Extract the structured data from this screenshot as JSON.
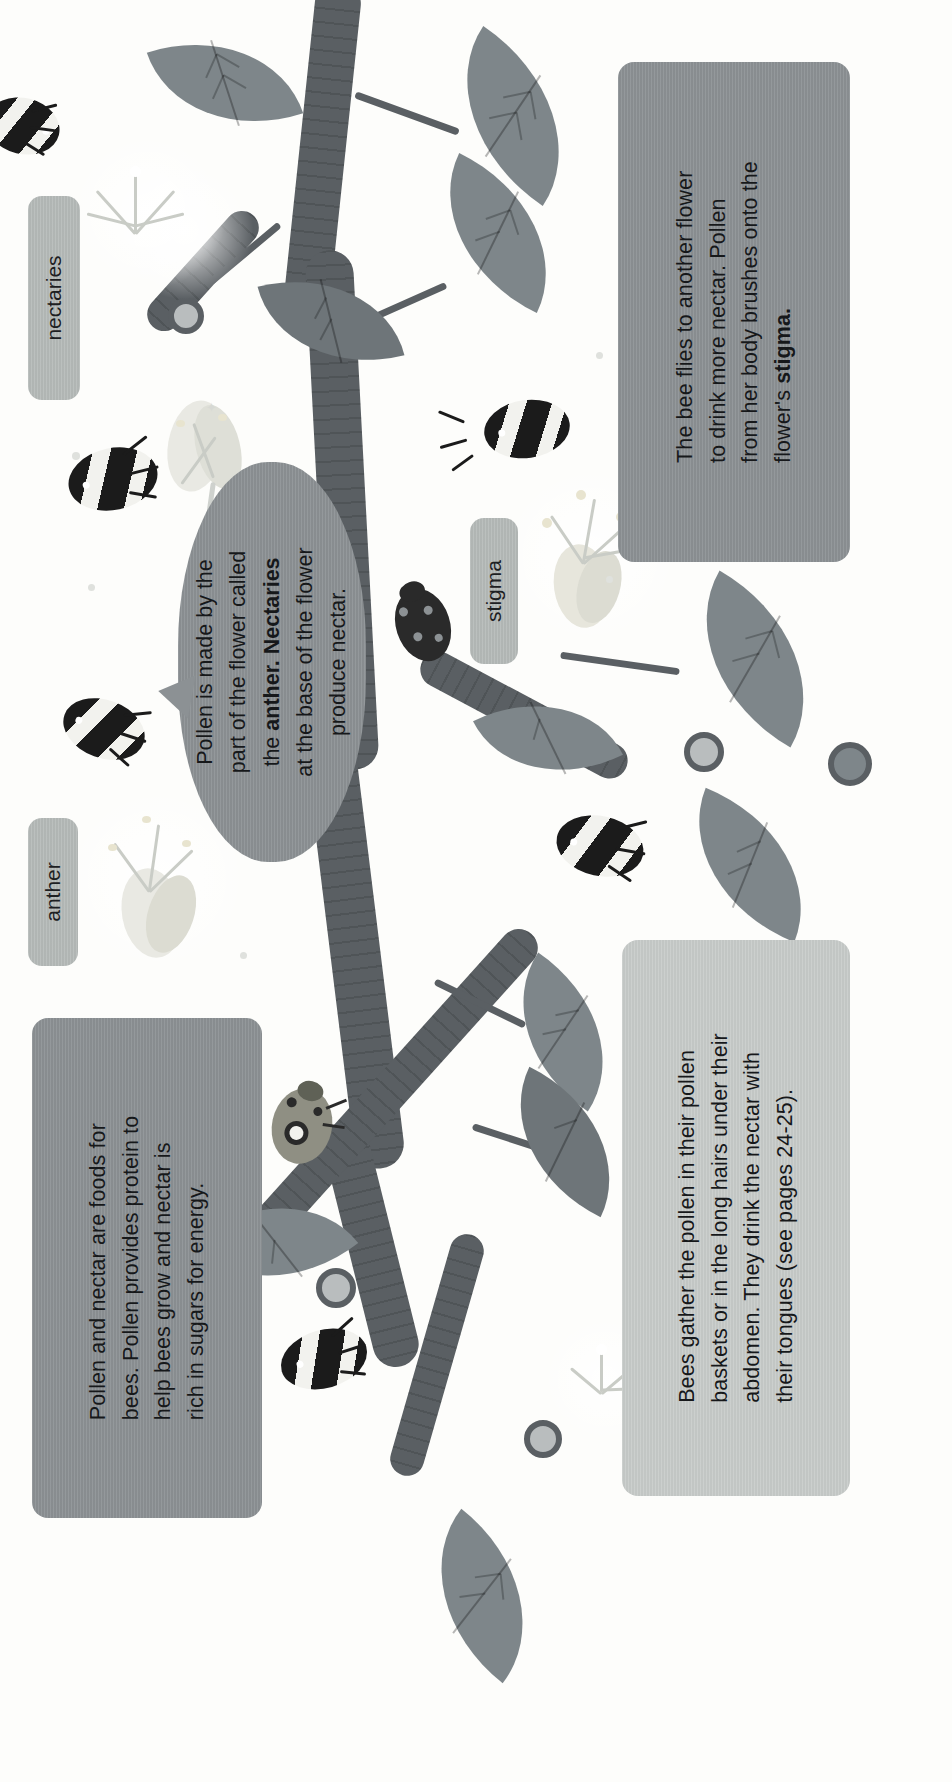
{
  "page": {
    "topic": "Bees and pollination illustrated spread",
    "orientation": "text rotated 90 degrees counter-clockwise",
    "background_color": "#fdfdfb"
  },
  "colors": {
    "panel_dark": "#8c9194",
    "panel_light": "#c8ccca",
    "tag": "#b6bbb9",
    "stem": "#5a5f63",
    "leaf": "#7e868a",
    "text": "#16181a"
  },
  "panels": {
    "bee_flies": {
      "name": "bee-flies-panel",
      "lines": [
        "The bee flies to another flower",
        "to drink more nectar. Pollen",
        "from her body brushes onto the"
      ],
      "last_line_prefix": "flower's ",
      "last_line_bold": "stigma."
    },
    "pollen_nectar_foods": {
      "name": "pollen-nectar-foods-panel",
      "lines": [
        "Pollen and nectar are foods for",
        "bees. Pollen provides protein to",
        "help bees grow and nectar is",
        "rich in sugars for energy."
      ]
    },
    "bees_gather": {
      "name": "bees-gather-panel",
      "lines": [
        "Bees gather the pollen in their pollen",
        "baskets or in the long hairs under their",
        "abdomen. They drink the nectar with",
        "their tongues (see pages 24-25)."
      ]
    }
  },
  "bubble": {
    "name": "pollen-made-bubble",
    "line1": "Pollen is made by the",
    "line2": "part of the flower called",
    "line3_prefix": "the ",
    "line3_bold": "anther. Nectaries",
    "line4": "at the base of the flower",
    "line5": "produce nectar."
  },
  "tags": [
    {
      "id": "nectaries",
      "label": "nectaries"
    },
    {
      "id": "stigma",
      "label": "stigma"
    },
    {
      "id": "anther",
      "label": "anther"
    }
  ],
  "icons": {
    "bee": "bee-icon",
    "ladybird": "ladybird-icon",
    "leaf": "leaf-icon",
    "flower": "flower-icon",
    "stem": "stem-icon"
  }
}
